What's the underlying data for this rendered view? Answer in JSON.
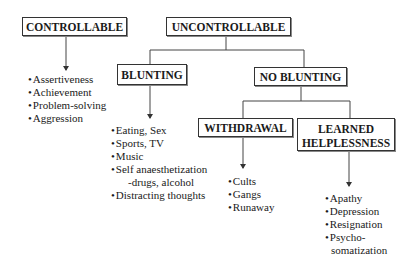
{
  "diagram": {
    "nodes": {
      "controllable": {
        "label": "CONTROLLABLE"
      },
      "uncontrollable": {
        "label": "UNCONTROLLABLE"
      },
      "blunting": {
        "label": "BLUNTING"
      },
      "no_blunting": {
        "label": "NO BLUNTING"
      },
      "withdrawal": {
        "label": "WITHDRAWAL"
      },
      "learned_helplessness": {
        "label_line1": "LEARNED",
        "label_line2": "HELPLESSNESS"
      }
    },
    "lists": {
      "controllable": [
        "Assertiveness",
        "Achievement",
        "Problem-solving",
        "Aggression"
      ],
      "blunting": [
        "Eating, Sex",
        "Sports, TV",
        "Music",
        "Self anaesthetization",
        "-drugs, alcohol",
        "Distracting thoughts"
      ],
      "withdrawal": [
        "Cults",
        "Gangs",
        "Runaway"
      ],
      "learned_helplessness": [
        "Apathy",
        "Depression",
        "Resignation",
        "Psycho-",
        "somatization"
      ]
    },
    "edges": [
      {
        "from": "controllable",
        "to": "controllable-list",
        "type": "arrow"
      },
      {
        "from": "uncontrollable",
        "to": "blunting",
        "type": "line"
      },
      {
        "from": "uncontrollable",
        "to": "no_blunting",
        "type": "line"
      },
      {
        "from": "blunting",
        "to": "blunting-list",
        "type": "arrow"
      },
      {
        "from": "no_blunting",
        "to": "withdrawal",
        "type": "line"
      },
      {
        "from": "no_blunting",
        "to": "learned_helplessness",
        "type": "line"
      },
      {
        "from": "withdrawal",
        "to": "withdrawal-list",
        "type": "arrow"
      },
      {
        "from": "learned_helplessness",
        "to": "learned_helplessness-list",
        "type": "arrow"
      }
    ]
  }
}
